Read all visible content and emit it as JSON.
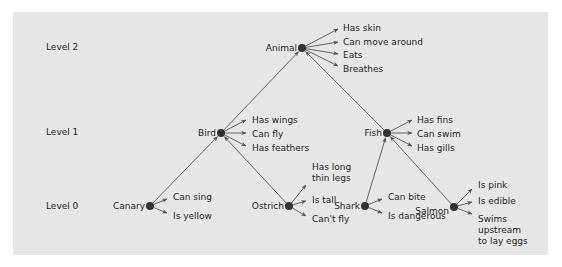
{
  "diagram": {
    "colors": {
      "background": "#e6e6e6",
      "line": "#555555",
      "node": "#333333",
      "text": "#1e1e1e"
    },
    "levels": [
      {
        "label": "Level 2",
        "x": 46,
        "y": 50
      },
      {
        "label": "Level 1",
        "x": 46,
        "y": 135
      },
      {
        "label": "Level 0",
        "x": 46,
        "y": 209
      }
    ],
    "nodes": [
      {
        "id": "animal",
        "label": "Animal",
        "x": 302,
        "y": 48,
        "label_x": 297,
        "label_y": 51,
        "anchor": "end",
        "properties": [
          {
            "text": "Has skin",
            "tx": 343,
            "ty": 31,
            "ax": 338,
            "ay": 29
          },
          {
            "text": "Can move around",
            "tx": 343,
            "ty": 45,
            "ax": 338,
            "ay": 42
          },
          {
            "text": "Eats",
            "tx": 343,
            "ty": 58,
            "ax": 338,
            "ay": 54
          },
          {
            "text": "Breathes",
            "tx": 343,
            "ty": 72,
            "ax": 338,
            "ay": 66
          }
        ]
      },
      {
        "id": "bird",
        "label": "Bird",
        "x": 221,
        "y": 133,
        "label_x": 216,
        "label_y": 136,
        "anchor": "end",
        "properties": [
          {
            "text": "Has wings",
            "tx": 252,
            "ty": 123,
            "ax": 246,
            "ay": 120
          },
          {
            "text": "Can fly",
            "tx": 252,
            "ty": 137,
            "ax": 246,
            "ay": 133
          },
          {
            "text": "Has feathers",
            "tx": 252,
            "ty": 151,
            "ax": 246,
            "ay": 146
          }
        ]
      },
      {
        "id": "fish",
        "label": "Fish",
        "x": 387,
        "y": 133,
        "label_x": 382,
        "label_y": 136,
        "anchor": "end",
        "properties": [
          {
            "text": "Has fins",
            "tx": 417,
            "ty": 123,
            "ax": 412,
            "ay": 120
          },
          {
            "text": "Can swim",
            "tx": 417,
            "ty": 137,
            "ax": 412,
            "ay": 133
          },
          {
            "text": "Has gills",
            "tx": 417,
            "ty": 151,
            "ax": 412,
            "ay": 146
          }
        ]
      },
      {
        "id": "canary",
        "label": "Canary",
        "x": 150,
        "y": 206,
        "label_x": 145,
        "label_y": 209,
        "anchor": "end",
        "properties": [
          {
            "text": "Can sing",
            "tx": 173,
            "ty": 200,
            "ax": 167,
            "ay": 199
          },
          {
            "text": "Is yellow",
            "tx": 173,
            "ty": 219,
            "ax": 167,
            "ay": 213
          }
        ]
      },
      {
        "id": "ostrich",
        "label": "Ostrich",
        "x": 289,
        "y": 206,
        "label_x": 284,
        "label_y": 209,
        "anchor": "end",
        "properties": [
          {
            "text": "Has long",
            "tx": 312,
            "ty": 170,
            "ax": 306,
            "ay": 185
          },
          {
            "text": "thin legs",
            "tx": 312,
            "ty": 181,
            "ax": null,
            "ay": null
          },
          {
            "text": "Is tall",
            "tx": 312,
            "ty": 203,
            "ax": 306,
            "ay": 201
          },
          {
            "text": "Can't fly",
            "tx": 312,
            "ty": 222,
            "ax": 306,
            "ay": 216
          }
        ]
      },
      {
        "id": "shark",
        "label": "Shark",
        "x": 365,
        "y": 206,
        "label_x": 360,
        "label_y": 209,
        "anchor": "end",
        "properties": [
          {
            "text": "Can bite",
            "tx": 388,
            "ty": 200,
            "ax": 382,
            "ay": 199
          },
          {
            "text": "Is dangerous",
            "tx": 388,
            "ty": 219,
            "ax": 382,
            "ay": 213
          }
        ]
      },
      {
        "id": "salmon",
        "label": "Salmon",
        "x": 454,
        "y": 207,
        "label_x": 449,
        "label_y": 214,
        "anchor": "end",
        "properties": [
          {
            "text": "Is pink",
            "tx": 478,
            "ty": 188,
            "ax": 472,
            "ay": 189
          },
          {
            "text": "Is edible",
            "tx": 478,
            "ty": 204,
            "ax": 472,
            "ay": 202
          },
          {
            "text": "Swims",
            "tx": 478,
            "ty": 222,
            "ax": 472,
            "ay": 214
          },
          {
            "text": "upstream",
            "tx": 478,
            "ty": 233,
            "ax": null,
            "ay": null
          },
          {
            "text": "to lay eggs",
            "tx": 478,
            "ty": 244,
            "ax": null,
            "ay": null
          }
        ]
      }
    ],
    "edges": [
      {
        "from": "bird",
        "to": "animal"
      },
      {
        "from": "fish",
        "to": "animal"
      },
      {
        "from": "canary",
        "to": "bird"
      },
      {
        "from": "ostrich",
        "to": "bird"
      },
      {
        "from": "shark",
        "to": "fish"
      },
      {
        "from": "salmon",
        "to": "fish"
      }
    ]
  }
}
